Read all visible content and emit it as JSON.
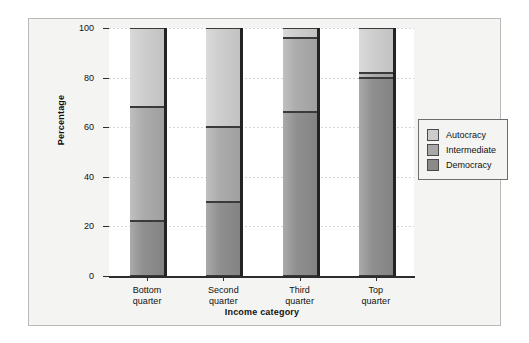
{
  "chart_data": {
    "type": "bar",
    "subtype": "stacked-100-percent",
    "title": "",
    "xlabel": "Income category",
    "ylabel": "Percentage",
    "categories": [
      "Bottom quarter",
      "Second quarter",
      "Third quarter",
      "Top quarter"
    ],
    "category_lines": [
      [
        "Bottom",
        "quarter"
      ],
      [
        "Second",
        "quarter"
      ],
      [
        "Third",
        "quarter"
      ],
      [
        "Top",
        "quarter"
      ]
    ],
    "ylim": [
      0,
      100
    ],
    "yticks": [
      0,
      20,
      40,
      60,
      80,
      100
    ],
    "ytick_labels": [
      "0",
      "20",
      "40",
      "60",
      "80",
      "100"
    ],
    "grid": true,
    "grid_axis": "y",
    "legend_position": "right",
    "stack_order_bottom_to_top": [
      "Democracy",
      "Intermediate",
      "Autocracy"
    ],
    "series": [
      {
        "name": "Democracy",
        "color": "#8a8a8a",
        "values": [
          22,
          30,
          66,
          80
        ]
      },
      {
        "name": "Intermediate",
        "color": "#a8a8a8",
        "values": [
          46,
          30,
          30,
          2
        ]
      },
      {
        "name": "Autocracy",
        "color": "#cccccc",
        "values": [
          32,
          40,
          4,
          18
        ]
      }
    ],
    "cumulative_boundaries": [
      [
        22,
        68,
        100
      ],
      [
        30,
        60,
        100
      ],
      [
        66,
        96,
        100
      ],
      [
        80,
        82,
        100
      ]
    ]
  },
  "legend": {
    "entries": [
      {
        "label": "Autocracy",
        "color": "#cccccc"
      },
      {
        "label": "Intermediate",
        "color": "#a8a8a8"
      },
      {
        "label": "Democracy",
        "color": "#8a8a8a"
      }
    ]
  },
  "colors": {
    "figure_background": "#f4f4f2",
    "plot_background": "#ffffff",
    "frame_border": "#b9b9b6",
    "axis": "#2d2d2d",
    "gridline": "#d2d7de",
    "text": "#111111",
    "bar_outline": "#3a3a3a",
    "bar_shadow": "#232323"
  }
}
